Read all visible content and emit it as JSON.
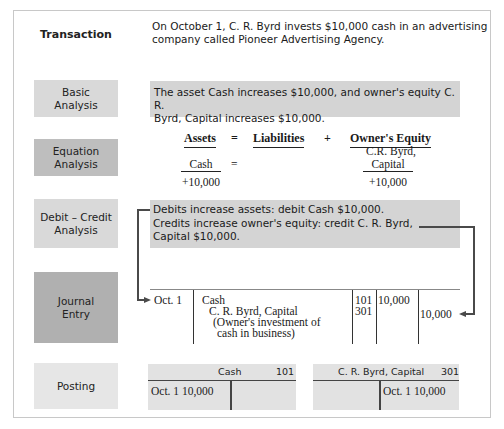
{
  "transaction": {
    "label": "Transaction",
    "text_line1": "On October 1, C. R. Byrd invests $10,000 cash in an advertising",
    "text_line2": "company called Pioneer Advertising Agency."
  },
  "basic_analysis": {
    "label_line1": "Basic",
    "label_line2": "Analysis",
    "text_line1": "The asset Cash increases $10,000, and owner's equity C. R.",
    "text_line2": "Byrd, Capital increases $10,000."
  },
  "equation_analysis": {
    "label_line1": "Equation",
    "label_line2": "Analysis",
    "headers": {
      "assets": "Assets",
      "equals": "=",
      "liabilities": "Liabilities",
      "plus": "+",
      "owners_equity": "Owner's Equity"
    },
    "assets_account": "Cash",
    "assets_change": "+10,000",
    "row_equals": "=",
    "equity_account_line1": "C.R. Byrd,",
    "equity_account_line2": "Capital",
    "equity_change": "+10,000"
  },
  "debit_credit_analysis": {
    "label_line1": "Debit – Credit",
    "label_line2": "Analysis",
    "text_line1": "Debits increase assets: debit Cash $10,000.",
    "text_line2": "Credits increase owner's equity: credit C. R. Byrd,",
    "text_line3": "Capital $10,000."
  },
  "journal_entry": {
    "label_line1": "Journal",
    "label_line2": "Entry",
    "date": "Oct. 1",
    "debit_account": "Cash",
    "credit_account": "C. R. Byrd, Capital",
    "explanation_line1": "(Owner's investment of",
    "explanation_line2": "cash in business)",
    "debit_ref": "101",
    "credit_ref": "301",
    "debit_amount": "10,000",
    "credit_amount": "10,000"
  },
  "posting": {
    "label": "Posting",
    "accounts": [
      {
        "name": "Cash",
        "number": "101",
        "side": "debit",
        "entry": "Oct. 1 10,000"
      },
      {
        "name": "C. R. Byrd, Capital",
        "number": "301",
        "side": "credit",
        "entry": "Oct. 1 10,000"
      }
    ]
  },
  "colors": {
    "label_light": "#d9d9d9",
    "label_medium": "#bebebe",
    "label_dark": "#b0b0b0",
    "label_lightest": "#e6e6e6",
    "text_box": "#d4d4d4",
    "connector": "#4a4a4a"
  }
}
